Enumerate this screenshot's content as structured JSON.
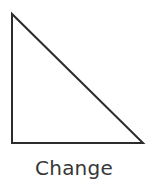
{
  "canvas": {
    "width": 148,
    "height": 185,
    "background_color": "#ffffff"
  },
  "figure": {
    "name": "right-triangle",
    "shape_type": "triangle",
    "variant": "right-triangle",
    "fill": "none",
    "stroke_color": "#2c2c2c",
    "stroke_width": 2,
    "right_angle_corner": "bottom-left",
    "vertices": [
      {
        "label": "top-left",
        "x": 12,
        "y": 14
      },
      {
        "label": "bottom-left",
        "x": 12,
        "y": 143
      },
      {
        "label": "bottom-right",
        "x": 143,
        "y": 143
      }
    ],
    "edges": [
      {
        "name": "vertical-leg",
        "from": "top-left",
        "to": "bottom-left"
      },
      {
        "name": "horizontal-leg",
        "from": "bottom-left",
        "to": "bottom-right"
      },
      {
        "name": "hypotenuse",
        "from": "top-left",
        "to": "bottom-right"
      }
    ],
    "path": "M 12 14 L 12 143 L 143 143 Z"
  },
  "caption": {
    "text": "Change",
    "color": "#373737",
    "font_size_px": 20,
    "align": "center"
  }
}
